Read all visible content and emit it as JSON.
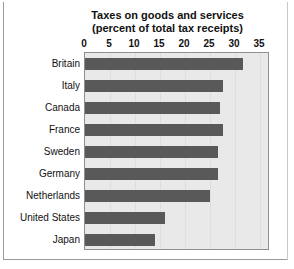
{
  "chart_data": {
    "type": "bar",
    "orientation": "horizontal",
    "title": "Taxes on goods and services",
    "subtitle": "(percent of total tax receipts)",
    "xlabel": "",
    "ylabel": "",
    "xlim": [
      0,
      37
    ],
    "xticks": [
      0,
      5,
      10,
      15,
      20,
      25,
      30,
      35
    ],
    "xtick_labels": [
      "0",
      "5",
      "10",
      "15",
      "20",
      "25",
      "30",
      "35"
    ],
    "grid": true,
    "legend": "none",
    "categories": [
      "Britain",
      "Italy",
      "Canada",
      "France",
      "Sweden",
      "Germany",
      "Netherlands",
      "United States",
      "Japan"
    ],
    "values": [
      31.5,
      27.5,
      27,
      27.5,
      26.5,
      26.5,
      25,
      16,
      14
    ],
    "bar_color": "#595959",
    "plot_background": "#e9e9e9",
    "gridline_color": "#dedede",
    "axis_color": "#8f8f8f",
    "text_color": "#111111"
  }
}
